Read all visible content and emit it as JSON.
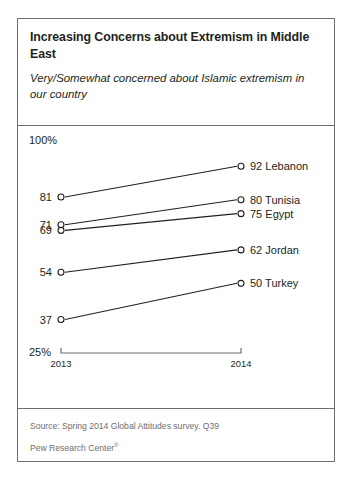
{
  "header": {
    "title": "Increasing Concerns about Extremism in Middle East",
    "subtitle": "Very/Somewhat concerned about Islamic extremism in our country"
  },
  "footer": {
    "source": "Source: Spring 2014 Global Attitudes survey. Q39",
    "attribution": "Pew Research Center",
    "attribution_mark": "®"
  },
  "axis": {
    "max_label": "100%",
    "min_label": "25%",
    "year_start": "2013",
    "year_end": "2014"
  },
  "chart_data": {
    "type": "line",
    "title": "Increasing Concerns about Extremism in Middle East",
    "subtitle": "Very/Somewhat concerned about Islamic extremism in our country",
    "xlabel": "",
    "ylabel": "",
    "x": [
      "2013",
      "2014"
    ],
    "ylim": [
      25,
      100
    ],
    "grid": false,
    "legend": "right-endpoint-labels",
    "series": [
      {
        "name": "Lebanon",
        "values": [
          81,
          92
        ],
        "start_label": "81",
        "end_label": "92 Lebanon"
      },
      {
        "name": "Tunisia",
        "values": [
          71,
          80
        ],
        "start_label": "71",
        "end_label": "80 Tunisia"
      },
      {
        "name": "Egypt",
        "values": [
          69,
          75
        ],
        "start_label": "69",
        "end_label": "75 Egypt"
      },
      {
        "name": "Jordan",
        "values": [
          54,
          62
        ],
        "start_label": "54",
        "end_label": "62 Jordan"
      },
      {
        "name": "Turkey",
        "values": [
          37,
          50
        ],
        "start_label": "37",
        "end_label": "50 Turkey"
      }
    ]
  }
}
